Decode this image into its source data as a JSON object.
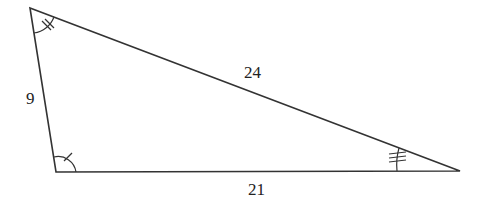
{
  "diagram": {
    "type": "triangle",
    "vertices": {
      "top_left": [
        30,
        8
      ],
      "bottom_left": [
        56,
        172
      ],
      "right": [
        460,
        171
      ]
    },
    "sides": [
      {
        "id": "left",
        "label": "9",
        "from": "top_left",
        "to": "bottom_left"
      },
      {
        "id": "hypotenuse",
        "label": "24",
        "from": "top_left",
        "to": "right"
      },
      {
        "id": "bottom",
        "label": "21",
        "from": "bottom_left",
        "to": "right"
      }
    ],
    "angle_marks": [
      {
        "vertex": "top_left",
        "ticks": 2
      },
      {
        "vertex": "bottom_left",
        "ticks": 1
      },
      {
        "vertex": "right",
        "ticks": 3
      }
    ],
    "line_color": "#333333"
  }
}
